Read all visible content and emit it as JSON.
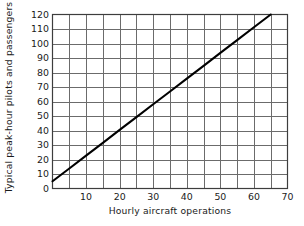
{
  "chart_data": {
    "type": "line",
    "title": "",
    "xlabel": "Hourly aircraft operations",
    "ylabel": "Typical peak-hour pilots and passengers",
    "xlim": [
      0,
      70
    ],
    "ylim": [
      0,
      120
    ],
    "xticks": [
      10,
      20,
      30,
      40,
      50,
      60,
      70
    ],
    "yticks": [
      0,
      10,
      20,
      30,
      40,
      50,
      60,
      70,
      80,
      90,
      100,
      110,
      120
    ],
    "xtick_labels": [
      "10",
      "20",
      "30",
      "40",
      "50",
      "60",
      "70"
    ],
    "ytick_labels": [
      "0",
      "10",
      "20",
      "30",
      "40",
      "50",
      "60",
      "70",
      "80",
      "90",
      "100",
      "110",
      "120"
    ],
    "x_minor_step": 5,
    "y_minor_step": 10,
    "grid": true,
    "legend": "none",
    "series": [
      {
        "name": "Typical peak-hour pilots and passengers",
        "color": "#000000",
        "x": [
          0,
          5,
          10,
          15,
          20,
          25,
          30,
          35,
          40,
          45,
          50,
          55,
          60,
          65
        ],
        "values": [
          5,
          13.8,
          22.7,
          31.5,
          40.4,
          49.2,
          58.1,
          66.9,
          75.8,
          84.6,
          93.5,
          102.3,
          111.2,
          120
        ]
      }
    ]
  },
  "colors": {
    "line": "#000000",
    "grid": "#6b6b6b",
    "frame": "#3d3d3d",
    "text": "#1a1a1a",
    "background": "#ffffff"
  }
}
